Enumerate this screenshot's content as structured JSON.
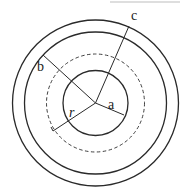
{
  "diagram": {
    "type": "concentric-circles",
    "center": {
      "x": 95.5,
      "y": 103
    },
    "stroke_color": "#2a2a2a",
    "top_rule": {
      "x1": 110,
      "y1": 2,
      "x2": 180,
      "y2": 2,
      "color": "#bdbdbd"
    },
    "circles": [
      {
        "name": "outer-shell-outer",
        "r": 83,
        "style": "solid"
      },
      {
        "name": "outer-shell-inner",
        "r": 71,
        "style": "solid"
      },
      {
        "name": "gaussian-surface",
        "r": 49,
        "style": "dashed"
      },
      {
        "name": "inner-sphere",
        "r": 32.5,
        "style": "solid"
      }
    ],
    "radii": [
      {
        "name": "radius-a",
        "x2": 124,
        "y2": 115,
        "label": "a",
        "label_x": 108,
        "label_y": 109,
        "italic": false
      },
      {
        "name": "radius-b",
        "x2": 43,
        "y2": 55,
        "label": "b",
        "label_x": 37,
        "label_y": 71,
        "italic": false
      },
      {
        "name": "radius-c",
        "x2": 129,
        "y2": 26,
        "label": "c",
        "label_x": 131,
        "label_y": 20,
        "italic": false
      },
      {
        "name": "radius-r",
        "x2": 53,
        "y2": 131,
        "label": "r",
        "label_x": 69,
        "label_y": 117,
        "italic": true
      }
    ],
    "r_tick": {
      "x1": 53,
      "y1": 131,
      "x2": 51,
      "y2": 127
    }
  }
}
